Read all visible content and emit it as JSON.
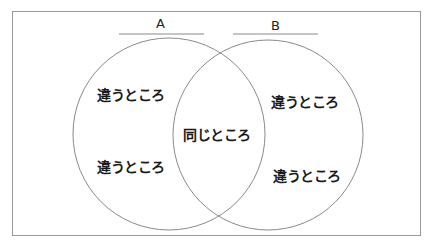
{
  "diagram": {
    "type": "venn",
    "sets": [
      {
        "name": "A",
        "region_labels": [
          "違うところ",
          "違うところ"
        ]
      },
      {
        "name": "B",
        "region_labels": [
          "違うところ",
          "違うところ"
        ]
      }
    ],
    "intersection_label": "同じところ"
  },
  "colors": {
    "frame": "#9a9a9a",
    "circle": "#8a8a8a",
    "title_line": "#8a8a8a",
    "text": "#1a1a1a"
  }
}
